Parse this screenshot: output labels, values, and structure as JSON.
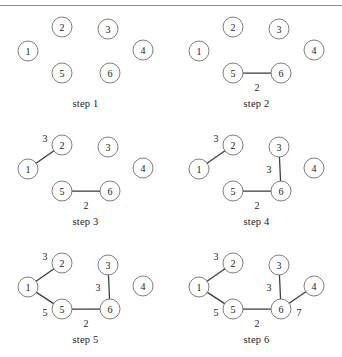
{
  "figure": {
    "rule_color": "#8a8a8a",
    "node_stroke": "#707070",
    "edge_color": "#3b3b3b",
    "node_radius": 10,
    "panel_width": 171,
    "panel_height": 118,
    "caption_y": 98
  },
  "nodes": [
    {
      "id": "1",
      "label": "1",
      "x": 28,
      "y": 51
    },
    {
      "id": "2",
      "label": "2",
      "x": 62,
      "y": 27
    },
    {
      "id": "3",
      "label": "3",
      "x": 108,
      "y": 29
    },
    {
      "id": "4",
      "label": "4",
      "x": 143,
      "y": 50
    },
    {
      "id": "5",
      "label": "5",
      "x": 62,
      "y": 73
    },
    {
      "id": "6",
      "label": "6",
      "x": 110,
      "y": 73
    }
  ],
  "panels": [
    {
      "name": "step-1",
      "caption": "step 1",
      "col": 0,
      "row": 0,
      "edges": []
    },
    {
      "name": "step-2",
      "caption": "step 2",
      "col": 1,
      "row": 0,
      "edges": [
        {
          "from": "5",
          "to": "6",
          "weight": "2",
          "wx": 86,
          "wy": 87
        }
      ]
    },
    {
      "name": "step-3",
      "caption": "step 3",
      "col": 0,
      "row": 1,
      "edges": [
        {
          "from": "5",
          "to": "6",
          "weight": "2",
          "wx": 86,
          "wy": 87
        },
        {
          "from": "1",
          "to": "2",
          "weight": "3",
          "wx": 45,
          "wy": 20
        }
      ]
    },
    {
      "name": "step-4",
      "caption": "step 4",
      "col": 1,
      "row": 1,
      "edges": [
        {
          "from": "5",
          "to": "6",
          "weight": "2",
          "wx": 86,
          "wy": 87
        },
        {
          "from": "1",
          "to": "2",
          "weight": "3",
          "wx": 45,
          "wy": 20
        },
        {
          "from": "3",
          "to": "6",
          "weight": "3",
          "wx": 98,
          "wy": 51
        }
      ]
    },
    {
      "name": "step-5",
      "caption": "step 5",
      "col": 0,
      "row": 2,
      "edges": [
        {
          "from": "5",
          "to": "6",
          "weight": "2",
          "wx": 86,
          "wy": 87
        },
        {
          "from": "1",
          "to": "2",
          "weight": "3",
          "wx": 45,
          "wy": 20
        },
        {
          "from": "3",
          "to": "6",
          "weight": "3",
          "wx": 98,
          "wy": 51
        },
        {
          "from": "1",
          "to": "5",
          "weight": "5",
          "wx": 45,
          "wy": 76
        }
      ]
    },
    {
      "name": "step-6",
      "caption": "step 6",
      "col": 1,
      "row": 2,
      "edges": [
        {
          "from": "5",
          "to": "6",
          "weight": "2",
          "wx": 86,
          "wy": 87
        },
        {
          "from": "1",
          "to": "2",
          "weight": "3",
          "wx": 45,
          "wy": 20
        },
        {
          "from": "3",
          "to": "6",
          "weight": "3",
          "wx": 98,
          "wy": 51
        },
        {
          "from": "1",
          "to": "5",
          "weight": "5",
          "wx": 45,
          "wy": 76
        },
        {
          "from": "6",
          "to": "4",
          "weight": "7",
          "wx": 128,
          "wy": 76
        }
      ]
    }
  ],
  "graph_summary": {
    "vertex_count": 6,
    "edges_final": [
      {
        "u": "5",
        "v": "6",
        "w": 2
      },
      {
        "u": "1",
        "v": "2",
        "w": 3
      },
      {
        "u": "3",
        "v": "6",
        "w": 3
      },
      {
        "u": "1",
        "v": "5",
        "w": 5
      },
      {
        "u": "6",
        "v": "4",
        "w": 7
      }
    ],
    "total_weight": 20
  }
}
